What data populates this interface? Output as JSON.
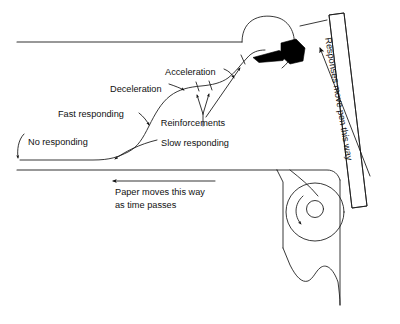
{
  "figure": {
    "type": "diagram",
    "title": "",
    "background_color": "#ffffff",
    "ink_color": "#111111"
  },
  "annotations": {
    "no_responding": "No responding",
    "slow_responding": "Slow responding",
    "fast_responding": "Fast responding",
    "deceleration": "Deceleration",
    "acceleration": "Acceleration",
    "reinforcements": "Reinforcements",
    "paper_direction_line1": "Paper moves this way",
    "paper_direction_line2": "as time passes",
    "pen_direction": "Responses move pen this way"
  },
  "parts": {
    "paper_sheet": "recording-paper",
    "cumulative_record_curve": "response-curve",
    "pen_carriage": "pen-and-carriage",
    "guide_rail": "hatched-guide-rail",
    "roller": "paper-drive-roller",
    "torn_edge": "torn-paper-edge"
  },
  "markers": {
    "reinforcement_ticks": 2,
    "paper_arrow_direction": "left",
    "pen_arrow_direction": "up-right",
    "roller_rotation": "counter-clockwise"
  }
}
